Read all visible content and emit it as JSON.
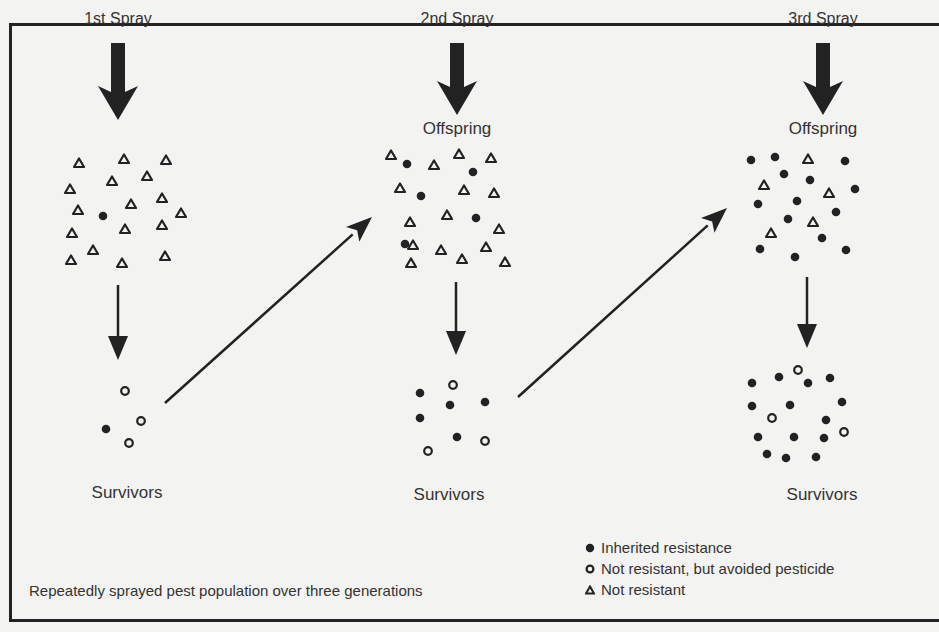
{
  "stages": [
    {
      "spray_label": "1st Spray",
      "population_label": "",
      "survivors_label": "Survivors"
    },
    {
      "spray_label": "2nd Spray",
      "population_label": "Offspring",
      "survivors_label": "Survivors"
    },
    {
      "spray_label": "3rd Spray",
      "population_label": "Offspring",
      "survivors_label": "Survivors"
    }
  ],
  "caption": "Repeatedly sprayed pest population over three generations",
  "legend": [
    {
      "symbol": "filled-dot",
      "label": "Inherited resistance"
    },
    {
      "symbol": "open-circle",
      "label": "Not resistant, but avoided pesticide"
    },
    {
      "symbol": "open-triangle",
      "label": "Not resistant"
    }
  ],
  "colors": {
    "ink": "#222222",
    "background": "#f3f3f1"
  },
  "populations": {
    "gen1": {
      "triangles": [
        [
          79,
          163
        ],
        [
          124,
          159
        ],
        [
          166,
          160
        ],
        [
          112,
          181
        ],
        [
          147,
          176
        ],
        [
          70,
          189
        ],
        [
          78,
          210
        ],
        [
          131,
          204
        ],
        [
          162,
          198
        ],
        [
          181,
          213
        ],
        [
          72,
          233
        ],
        [
          125,
          229
        ],
        [
          162,
          225
        ],
        [
          71,
          260
        ],
        [
          93,
          250
        ],
        [
          122,
          263
        ],
        [
          165,
          256
        ]
      ],
      "dots": [
        [
          103,
          216
        ]
      ],
      "rings": []
    },
    "gen1_survivors": {
      "triangles": [],
      "dots": [
        [
          106,
          429
        ]
      ],
      "rings": [
        [
          125,
          391
        ],
        [
          141,
          421
        ],
        [
          129,
          443
        ]
      ]
    },
    "gen2": {
      "triangles": [
        [
          391,
          155
        ],
        [
          434,
          165
        ],
        [
          459,
          154
        ],
        [
          491,
          158
        ],
        [
          400,
          188
        ],
        [
          464,
          190
        ],
        [
          494,
          193
        ],
        [
          410,
          222
        ],
        [
          447,
          215
        ],
        [
          499,
          229
        ],
        [
          413,
          245
        ],
        [
          441,
          250
        ],
        [
          486,
          247
        ],
        [
          411,
          263
        ],
        [
          462,
          259
        ],
        [
          505,
          262
        ]
      ],
      "dots": [
        [
          407,
          164
        ],
        [
          473,
          172
        ],
        [
          421,
          196
        ],
        [
          476,
          218
        ],
        [
          405,
          244
        ]
      ],
      "rings": []
    },
    "gen2_survivors": {
      "triangles": [],
      "dots": [
        [
          420,
          393
        ],
        [
          450,
          405
        ],
        [
          485,
          402
        ],
        [
          420,
          418
        ],
        [
          457,
          437
        ]
      ],
      "rings": [
        [
          453,
          385
        ],
        [
          485,
          441
        ],
        [
          428,
          451
        ]
      ]
    },
    "gen3": {
      "triangles": [
        [
          808,
          159
        ],
        [
          764,
          185
        ],
        [
          829,
          193
        ],
        [
          813,
          222
        ],
        [
          771,
          233
        ]
      ],
      "dots": [
        [
          751,
          160
        ],
        [
          775,
          157
        ],
        [
          845,
          161
        ],
        [
          784,
          174
        ],
        [
          810,
          180
        ],
        [
          855,
          189
        ],
        [
          758,
          204
        ],
        [
          797,
          201
        ],
        [
          836,
          212
        ],
        [
          788,
          219
        ],
        [
          822,
          238
        ],
        [
          760,
          249
        ],
        [
          795,
          257
        ],
        [
          846,
          250
        ]
      ],
      "rings": []
    },
    "gen3_survivors": {
      "triangles": [],
      "dots": [
        [
          752,
          383
        ],
        [
          779,
          377
        ],
        [
          808,
          383
        ],
        [
          830,
          378
        ],
        [
          752,
          406
        ],
        [
          790,
          405
        ],
        [
          842,
          402
        ],
        [
          826,
          420
        ],
        [
          758,
          437
        ],
        [
          794,
          437
        ],
        [
          824,
          438
        ],
        [
          767,
          454
        ],
        [
          786,
          458
        ],
        [
          816,
          457
        ]
      ],
      "rings": [
        [
          798,
          370
        ],
        [
          772,
          418
        ],
        [
          844,
          432
        ]
      ]
    }
  },
  "arrows": {
    "spray": [
      [
        118,
        43,
        118,
        120
      ],
      [
        457,
        43,
        457,
        115
      ],
      [
        823,
        43,
        823,
        115
      ]
    ],
    "down": [
      [
        118,
        285,
        118,
        360
      ],
      [
        456,
        282,
        456,
        355
      ],
      [
        807,
        277,
        807,
        348
      ]
    ],
    "diagonal": [
      [
        165,
        403,
        372,
        217
      ],
      [
        518,
        397,
        727,
        208
      ]
    ]
  }
}
